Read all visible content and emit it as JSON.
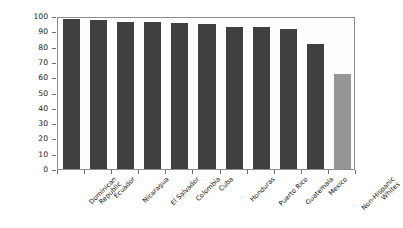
{
  "chart_data": {
    "type": "bar",
    "title": "",
    "xlabel": "",
    "ylabel": "Percentage Living in Urban Areas",
    "ylim": [
      0,
      100
    ],
    "yticks": [
      100,
      90,
      80,
      70,
      60,
      50,
      40,
      30,
      20,
      10,
      0
    ],
    "grid": false,
    "legend": "none",
    "categories": [
      "Dominican Republic",
      "Ecuador",
      "Nicaragua",
      "El Salvador",
      "Colombia",
      "Cuba",
      "Honduras",
      "Puerto Rico",
      "Guatemala",
      "Mexico",
      "Non-Hispanic Whites"
    ],
    "category_lines": [
      [
        "Dominican",
        "Republic"
      ],
      [
        "Ecuador"
      ],
      [
        "Nicaragua"
      ],
      [
        "El Salvador"
      ],
      [
        "Colombia"
      ],
      [
        "Cuba"
      ],
      [
        "Honduras"
      ],
      [
        "Puerto Rico"
      ],
      [
        "Guatemala"
      ],
      [
        "Mexico"
      ],
      [
        "Non-Hispanic",
        "Whites"
      ]
    ],
    "values": [
      98.2,
      97.1,
      96.4,
      95.9,
      95.4,
      94.6,
      92.8,
      92.5,
      91.6,
      81.5,
      61.8
    ],
    "data_labels": [
      "98.2%",
      "97.1%",
      "96.4%",
      "95.9%",
      "95.4%",
      "94.6%",
      "92.8%",
      "92.5%",
      "91.6%",
      "81.5%",
      "61.8%"
    ],
    "bar_colors": [
      "#404040",
      "#404040",
      "#404040",
      "#404040",
      "#404040",
      "#404040",
      "#404040",
      "#404040",
      "#404040",
      "#404040",
      "#969696"
    ]
  },
  "colors": {
    "bar_primary": "#404040",
    "bar_highlight": "#969696",
    "axis": "#8c8c8c",
    "background": "#ffffff",
    "plot_background": "#fdfdfd",
    "text": "#111111"
  }
}
